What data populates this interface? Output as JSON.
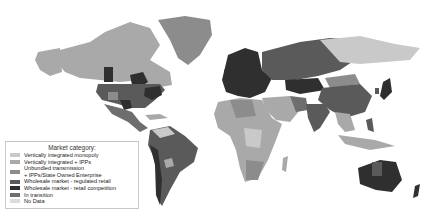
{
  "map": {
    "title": "World electricity market structure",
    "colors": {
      "vertically_integrated_monopoly": "#c9c9c9",
      "vertically_integrated_ipps": "#a9a9a9",
      "unbundled_ipps_soe": "#8c8c8c",
      "wholesale_regulated_retail": "#5a5a5a",
      "wholesale_retail_competition": "#2f2f2f",
      "in_transition": "#6e6e6e",
      "no_data": "#dcdcdc"
    }
  },
  "legend": {
    "title": "Market category:",
    "items": [
      {
        "label": "Vertically integrated monopoly",
        "color": "#c9c9c9"
      },
      {
        "label": "Vertically integrated + IPPs",
        "color": "#a9a9a9"
      },
      {
        "label": "Unbundled transmission\n+ IPPs/State Owned Enterprise",
        "color": "#8c8c8c"
      },
      {
        "label": "Wholesale market - regulated retail",
        "color": "#5a5a5a"
      },
      {
        "label": "Wholesale market - retail competition",
        "color": "#2f2f2f"
      },
      {
        "label": "In transition",
        "color": "#6e6e6e"
      },
      {
        "label": "No Data",
        "color": "#dcdcdc"
      }
    ]
  }
}
